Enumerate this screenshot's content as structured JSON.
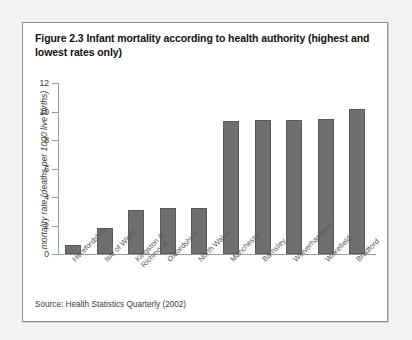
{
  "figure": {
    "title": "Figure 2.3 Infant mortality according to health authority (highest and lowest rates only)",
    "source": "Source: Health Statistics Quarterly (2002)"
  },
  "chart_data": {
    "type": "bar",
    "title": "Figure 2.3 Infant mortality according to health authority (highest and lowest rates only)",
    "xlabel": "",
    "ylabel": "mortality rate (deaths per 1000 live births)",
    "ylim": [
      0,
      12
    ],
    "yticks": [
      0,
      2,
      4,
      6,
      8,
      10,
      12
    ],
    "ytick_labels": [
      "0",
      "2",
      "4",
      "6",
      "8",
      "10",
      "12"
    ],
    "grid": false,
    "legend": false,
    "bar_color": "#6f6f6f",
    "categories": [
      "Herefordshire",
      "Isle of Wight",
      "Kingston & Richmond",
      "Oxfordshire",
      "North Wales",
      "Manchester",
      "Barnsley",
      "Wolverhampton",
      "Wakefield",
      "Bradford"
    ],
    "category_lines": [
      [
        "Herefordshire"
      ],
      [
        "Isle of Wight"
      ],
      [
        "Kingston &",
        "Richmond"
      ],
      [
        "Oxfordshire"
      ],
      [
        "North Wales"
      ],
      [
        "Manchester"
      ],
      [
        "Barnsley"
      ],
      [
        "Wolverhampton"
      ],
      [
        "Wakefield"
      ],
      [
        "Bradford"
      ]
    ],
    "values": [
      0.6,
      1.8,
      3.1,
      3.2,
      3.2,
      9.3,
      9.4,
      9.4,
      9.5,
      10.2
    ],
    "source": "Source: Health Statistics Quarterly (2002)"
  }
}
